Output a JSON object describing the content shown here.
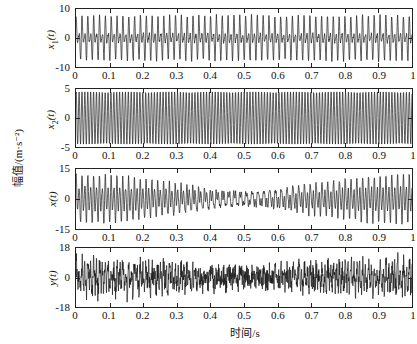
{
  "chart_data": [
    {
      "type": "line",
      "panel": 1,
      "ylabel": "x1(t)",
      "ylabel_base": "x",
      "ylabel_sub": "1",
      "ylabel_suffix": "(t)",
      "ylim": [
        -10,
        10
      ],
      "yticks": [
        "10",
        "0",
        "-10"
      ],
      "xlim": [
        0,
        1
      ],
      "xticks": [
        "0",
        "0.1",
        "0.2",
        "0.3",
        "0.4",
        "0.5",
        "0.6",
        "0.7",
        "0.8",
        "0.9",
        "1"
      ],
      "signal": "multi-harmonic periodic signal, peak amplitude ~9",
      "components": [
        {
          "freq": 115,
          "amp": 4.5
        },
        {
          "freq": 57.5,
          "amp": 3.0
        },
        {
          "freq": 172.5,
          "amp": 1.5
        }
      ],
      "noise": 0.3
    },
    {
      "type": "line",
      "panel": 2,
      "ylabel": "x2(t)",
      "ylabel_base": "x",
      "ylabel_sub": "2",
      "ylabel_suffix": "(t)",
      "ylim": [
        -5,
        5
      ],
      "yticks": [
        "5",
        "0",
        "-5"
      ],
      "xlim": [
        0,
        1
      ],
      "xticks": [
        "0",
        "0.1",
        "0.2",
        "0.3",
        "0.4",
        "0.5",
        "0.6",
        "0.7",
        "0.8",
        "0.9",
        "1"
      ],
      "signal": "pure sinusoid, amplitude ~4.5, ~116 cycles over 1 s",
      "components": [
        {
          "freq": 116,
          "amp": 4.5
        }
      ],
      "noise": 0.0
    },
    {
      "type": "line",
      "panel": 3,
      "ylabel": "x(t)",
      "ylabel_base": "x",
      "ylabel_sub": "",
      "ylabel_suffix": "(t)",
      "ylim": [
        -15,
        15
      ],
      "yticks": [
        "15",
        "0",
        "-15"
      ],
      "xlim": [
        0,
        1
      ],
      "xticks": [
        "0",
        "0.1",
        "0.2",
        "0.3",
        "0.4",
        "0.5",
        "0.6",
        "0.7",
        "0.8",
        "0.9",
        "1"
      ],
      "signal": "mixed signal x1 + x2, peak amplitude ~13",
      "components": [
        {
          "freq": 115,
          "amp": 4.5
        },
        {
          "freq": 57.5,
          "amp": 3.0
        },
        {
          "freq": 172.5,
          "amp": 1.5
        },
        {
          "freq": 116,
          "amp": 4.5
        }
      ],
      "noise": 0.5
    },
    {
      "type": "line",
      "panel": 4,
      "ylabel": "y(t)",
      "ylabel_base": "y",
      "ylabel_sub": "",
      "ylabel_suffix": "(t)",
      "ylim": [
        -18,
        18
      ],
      "yticks": [
        "18",
        "0",
        "-18"
      ],
      "xlim": [
        0,
        1
      ],
      "xticks": [
        "0",
        "0.1",
        "0.2",
        "0.3",
        "0.4",
        "0.5",
        "0.6",
        "0.7",
        "0.8",
        "0.9",
        "1"
      ],
      "signal": "noisy observed signal, peak amplitude ~16",
      "components": [
        {
          "freq": 115,
          "amp": 3.5
        },
        {
          "freq": 57.5,
          "amp": 2.5
        },
        {
          "freq": 116,
          "amp": 3.5
        }
      ],
      "noise": 4.0
    }
  ],
  "labels": {
    "shared_ylabel": "幅值/(m·s⁻²)",
    "shared_xlabel": "时间/s"
  },
  "colors": {
    "line": "#1a1a1a",
    "axes": "#222222"
  }
}
